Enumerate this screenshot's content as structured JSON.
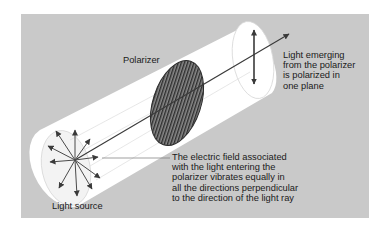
{
  "diagram": {
    "labels": {
      "polarizer": "Polarizer",
      "emerging_light": "Light emerging\nfrom the polarizer\nis polarized in\none plane",
      "electric_field": "The electric field associated\nwith the light entering the\npolarizer vibrates equally in\nall the directions perpendicular\nto the direction of the light ray",
      "light_source": "Light source"
    },
    "colors": {
      "background": "#c9c9c9",
      "cylinder": "#ffffff",
      "ink": "#3a3a3a",
      "polarizer_fill": "#6a6a6a"
    },
    "elements": [
      "light-source-arrows-radial",
      "light-beam-cylinder",
      "polarizer-disc-vertical-grating",
      "polarized-vertical-double-arrow",
      "propagation-ray-arrow"
    ]
  }
}
